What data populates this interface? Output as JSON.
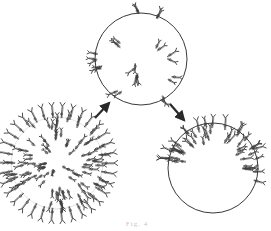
{
  "figure": {
    "caption_fragment": "Fig. 4",
    "colors": {
      "stroke": "#3a3a3a",
      "background": "#ffffff",
      "arrow": "#2a2a2a"
    },
    "panels": [
      {
        "id": "uniform",
        "label": "uniform-distribution",
        "cx": 57,
        "cy": 163,
        "r": 48,
        "receptor_count": 90,
        "spike_len": 12
      },
      {
        "id": "patching",
        "label": "patched-receptors",
        "cx": 141,
        "cy": 59,
        "r": 46,
        "receptor_count": 26
      },
      {
        "id": "capping",
        "label": "capped-receptors",
        "cx": 213,
        "cy": 168,
        "r": 45,
        "receptor_count": 48
      }
    ],
    "arrows": [
      {
        "id": "arrow-uniform-to-patching",
        "x1": 95,
        "y1": 118,
        "x2": 109,
        "y2": 103
      },
      {
        "id": "arrow-patching-to-capping",
        "x1": 170,
        "y1": 104,
        "x2": 184,
        "y2": 120
      }
    ]
  }
}
